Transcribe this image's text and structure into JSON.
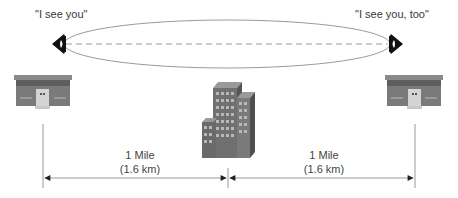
{
  "diagram": {
    "left_observer": {
      "quote": "\"I see you\"",
      "icon": "eye-icon-facing-right"
    },
    "right_observer": {
      "quote": "\"I see you, too\"",
      "icon": "eye-icon-facing-left"
    },
    "line_of_sight": {
      "style": "dashed",
      "fresnel_zone": "ellipse"
    },
    "left_building": {
      "icon": "small-house-icon"
    },
    "center_obstacle": {
      "icon": "office-tower-icon"
    },
    "right_building": {
      "icon": "small-house-icon"
    },
    "segments": [
      {
        "line1": "1 Mile",
        "line2": "(1.6 km)"
      },
      {
        "line1": "1 Mile",
        "line2": "(1.6 km)"
      }
    ],
    "colors": {
      "line": "#9a9a9a",
      "eye": "#111111",
      "building_dark": "#6f6f6f",
      "building_light": "#a8a8a8"
    }
  }
}
